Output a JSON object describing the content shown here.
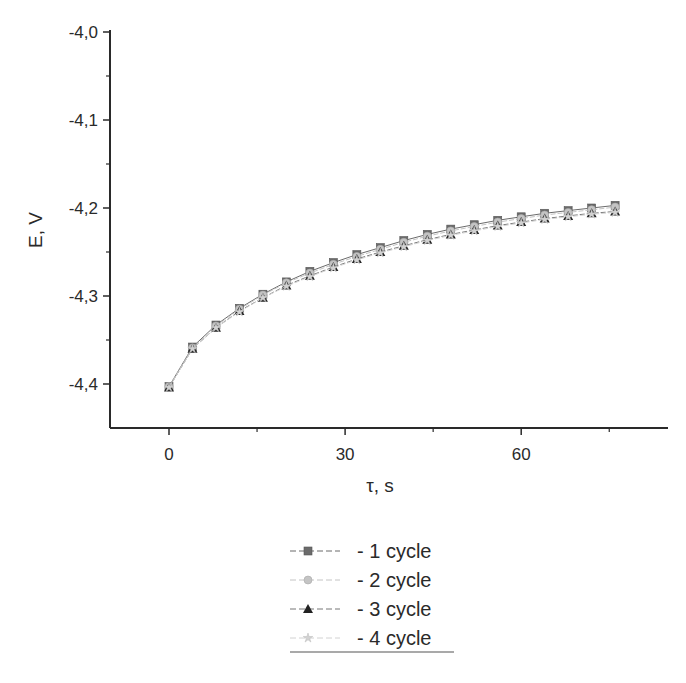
{
  "chart_data": {
    "type": "line",
    "title": "",
    "xlabel": "τ, s",
    "ylabel": "E, V",
    "xlim": [
      -10,
      85
    ],
    "ylim": [
      -4.45,
      -4.0
    ],
    "x_ticks": [
      0,
      30,
      60
    ],
    "x_tick_labels": [
      "0",
      "30",
      "60"
    ],
    "x_minor_ticks": [
      15,
      45,
      75
    ],
    "y_ticks": [
      -4.0,
      -4.1,
      -4.2,
      -4.3,
      -4.4
    ],
    "y_tick_labels": [
      "-4,0",
      "-4,1",
      "-4,2",
      "-4,3",
      "-4,4"
    ],
    "y_minor_ticks": [
      -4.05,
      -4.15,
      -4.25,
      -4.35
    ],
    "grid": false,
    "legend_position": "bottom-center",
    "x": [
      0,
      4,
      8,
      12,
      16,
      20,
      24,
      28,
      32,
      36,
      40,
      44,
      48,
      52,
      56,
      60,
      64,
      68,
      72,
      76
    ],
    "series": [
      {
        "name": "- 1 cycle",
        "marker": "square",
        "color": "#6b6b6b",
        "values": [
          -4.403,
          -4.358,
          -4.333,
          -4.314,
          -4.298,
          -4.284,
          -4.272,
          -4.262,
          -4.253,
          -4.245,
          -4.237,
          -4.23,
          -4.224,
          -4.219,
          -4.214,
          -4.21,
          -4.206,
          -4.203,
          -4.2,
          -4.197
        ]
      },
      {
        "name": "- 2 cycle",
        "marker": "circle",
        "color": "#c4c4c4",
        "values": [
          -4.403,
          -4.359,
          -4.334,
          -4.315,
          -4.299,
          -4.285,
          -4.274,
          -4.264,
          -4.255,
          -4.247,
          -4.239,
          -4.232,
          -4.226,
          -4.221,
          -4.216,
          -4.212,
          -4.208,
          -4.205,
          -4.202,
          -4.199
        ]
      },
      {
        "name": "- 3 cycle",
        "marker": "triangle",
        "color": "#222222",
        "values": [
          -4.404,
          -4.36,
          -4.336,
          -4.317,
          -4.302,
          -4.288,
          -4.277,
          -4.267,
          -4.258,
          -4.25,
          -4.243,
          -4.236,
          -4.23,
          -4.225,
          -4.22,
          -4.216,
          -4.212,
          -4.209,
          -4.206,
          -4.204
        ]
      },
      {
        "name": "- 4 cycle",
        "marker": "star",
        "color": "#d2d2d2",
        "values": [
          -4.404,
          -4.36,
          -4.336,
          -4.318,
          -4.302,
          -4.289,
          -4.278,
          -4.268,
          -4.259,
          -4.251,
          -4.244,
          -4.237,
          -4.231,
          -4.226,
          -4.221,
          -4.217,
          -4.213,
          -4.21,
          -4.207,
          -4.205
        ]
      }
    ]
  }
}
